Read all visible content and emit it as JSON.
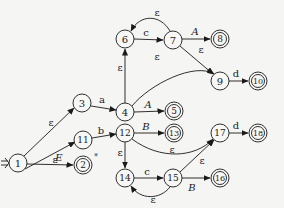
{
  "diagram": {
    "type": "nfa-state-graph",
    "start_arrow": "⇒",
    "states": [
      {
        "id": "1",
        "x": 18,
        "y": 163,
        "accepting": false
      },
      {
        "id": "2",
        "x": 83,
        "y": 165,
        "accepting": true,
        "mark": "*"
      },
      {
        "id": "3",
        "x": 82,
        "y": 103,
        "accepting": false
      },
      {
        "id": "4",
        "x": 125,
        "y": 112,
        "accepting": false
      },
      {
        "id": "5",
        "x": 174,
        "y": 111,
        "accepting": true
      },
      {
        "id": "6",
        "x": 125,
        "y": 39,
        "accepting": false
      },
      {
        "id": "7",
        "x": 173,
        "y": 40,
        "accepting": false
      },
      {
        "id": "8",
        "x": 220,
        "y": 39,
        "accepting": true
      },
      {
        "id": "9",
        "x": 220,
        "y": 81,
        "accepting": false
      },
      {
        "id": "10",
        "x": 258,
        "y": 81,
        "accepting": true
      },
      {
        "id": "11",
        "x": 83,
        "y": 140,
        "accepting": false
      },
      {
        "id": "12",
        "x": 125,
        "y": 133,
        "accepting": false
      },
      {
        "id": "13",
        "x": 174,
        "y": 133,
        "accepting": true
      },
      {
        "id": "14",
        "x": 125,
        "y": 178,
        "accepting": false
      },
      {
        "id": "15",
        "x": 173,
        "y": 178,
        "accepting": false
      },
      {
        "id": "16",
        "x": 220,
        "y": 178,
        "accepting": true
      },
      {
        "id": "17",
        "x": 220,
        "y": 133,
        "accepting": false
      },
      {
        "id": "18",
        "x": 258,
        "y": 133,
        "accepting": true
      }
    ],
    "transitions": [
      {
        "from": "1",
        "to": "3",
        "label": "ε"
      },
      {
        "from": "1",
        "to": "2",
        "label": "E"
      },
      {
        "from": "1",
        "to": "11",
        "label": "ε"
      },
      {
        "from": "3",
        "to": "4",
        "label": "a"
      },
      {
        "from": "4",
        "to": "6",
        "label": "ε"
      },
      {
        "from": "4",
        "to": "5",
        "label": "A"
      },
      {
        "from": "4",
        "to": "9",
        "label": "ε"
      },
      {
        "from": "6",
        "to": "7",
        "label": "c"
      },
      {
        "from": "7",
        "to": "6",
        "label": "ε"
      },
      {
        "from": "7",
        "to": "8",
        "label": "A"
      },
      {
        "from": "7",
        "to": "9",
        "label": "ε"
      },
      {
        "from": "9",
        "to": "10",
        "label": "d"
      },
      {
        "from": "11",
        "to": "12",
        "label": "b"
      },
      {
        "from": "12",
        "to": "13",
        "label": "B"
      },
      {
        "from": "12",
        "to": "14",
        "label": "ε"
      },
      {
        "from": "12",
        "to": "17",
        "label": "ε"
      },
      {
        "from": "14",
        "to": "15",
        "label": "c"
      },
      {
        "from": "15",
        "to": "14",
        "label": "ε"
      },
      {
        "from": "15",
        "to": "16",
        "label": "B"
      },
      {
        "from": "15",
        "to": "17",
        "label": "ε"
      },
      {
        "from": "17",
        "to": "18",
        "label": "d"
      }
    ]
  },
  "labels": {
    "start": "⇒",
    "s1": "1",
    "s2": "2",
    "s3": "3",
    "s4": "4",
    "s5": "5",
    "s6": "6",
    "s7": "7",
    "s8": "8",
    "s9": "9",
    "s10": "10",
    "s11": "11",
    "s12": "12",
    "s13": "13",
    "s14": "14",
    "s15": "15",
    "s16": "16",
    "s17": "17",
    "s18": "18",
    "star": "*",
    "e_1_3": "ε",
    "e_1_2": "E",
    "e_1_11": "ε",
    "e_3_4": "a",
    "e_4_6": "ε",
    "e_4_5": "A",
    "e_4_9": "ε",
    "e_6_7": "c",
    "e_7_6": "ε",
    "e_7_8": "A",
    "e_7_9": "ε",
    "e_9_10": "d",
    "e_11_12": "b",
    "e_12_13": "B",
    "e_12_14": "ε",
    "e_12_17": "ε",
    "e_14_15": "c",
    "e_15_14": "ε",
    "e_15_16": "B",
    "e_15_17": "ε",
    "e_17_18": "d"
  }
}
